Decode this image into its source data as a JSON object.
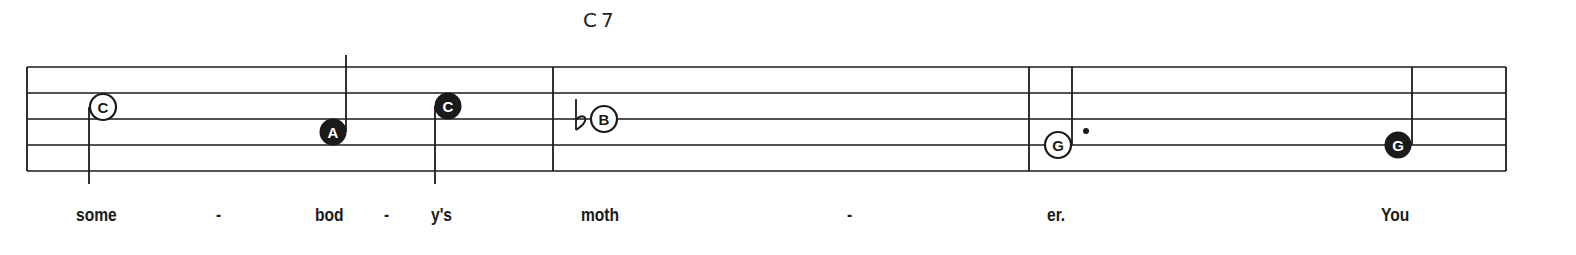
{
  "score": {
    "chord_symbols": [
      {
        "label": "C7",
        "x": 583
      }
    ],
    "staff": {
      "left": 27,
      "right": 1506,
      "lines_y": [
        67,
        93,
        119,
        145,
        171
      ],
      "barlines_x": [
        553,
        1029,
        1506
      ]
    },
    "notes": [
      {
        "name": "C",
        "filled": false,
        "cx": 103,
        "cy": 107,
        "stem": "down",
        "accidental": null,
        "dot": false,
        "lyric": "some"
      },
      {
        "name": "A",
        "filled": true,
        "cx": 333,
        "cy": 132,
        "stem": "up",
        "accidental": null,
        "dot": false,
        "lyric": "bod"
      },
      {
        "name": "C",
        "filled": true,
        "cx": 448,
        "cy": 106,
        "stem": "down",
        "accidental": null,
        "dot": false,
        "lyric": "y's"
      },
      {
        "name": "B",
        "filled": false,
        "cx": 604,
        "cy": 119,
        "stem": "none",
        "accidental": "flat",
        "dot": false,
        "lyric": "moth"
      },
      {
        "name": "G",
        "filled": false,
        "cx": 1058,
        "cy": 145,
        "stem": "up",
        "accidental": null,
        "dot": true,
        "lyric": "er."
      },
      {
        "name": "G",
        "filled": true,
        "cx": 1398,
        "cy": 145,
        "stem": "up",
        "accidental": null,
        "dot": false,
        "lyric": "You"
      }
    ],
    "lyrics": [
      {
        "text": "some",
        "x": 76
      },
      {
        "text": "-",
        "x": 216
      },
      {
        "text": "bod",
        "x": 315
      },
      {
        "text": "-",
        "x": 384
      },
      {
        "text": "y's",
        "x": 431
      },
      {
        "text": "moth",
        "x": 581
      },
      {
        "text": "-",
        "x": 847
      },
      {
        "text": "er.",
        "x": 1047
      },
      {
        "text": "You",
        "x": 1381
      }
    ],
    "colors": {
      "ink": "#1a1a1a",
      "paper": "#ffffff"
    }
  }
}
